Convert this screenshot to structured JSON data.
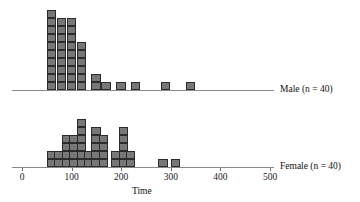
{
  "figure": {
    "axis_title": "Time",
    "male_label": "Male (n = 40)",
    "female_label": "Female (n = 40)",
    "cell_color": "#777777",
    "cell_border_color": "#2b2b2b",
    "axis_color": "#8a8a8a"
  },
  "chart_data": {
    "type": "bar",
    "title": "",
    "subtitle": "",
    "xlabel": "Time",
    "ylabel": "",
    "xlim": [
      0,
      500
    ],
    "grid": false,
    "legend_position": "right",
    "bin_width": 20,
    "tick_values": [
      0,
      100,
      200,
      300,
      400,
      500
    ],
    "tick_labels": [
      "0",
      "100",
      "200",
      "300",
      "400",
      "500"
    ],
    "note": "Back-to-back stacked dotplot / histogram; each square = 1 observation",
    "series": [
      {
        "name": "Male (n = 40)",
        "n": 40,
        "bins": [
          50,
          70,
          90,
          110,
          140,
          160,
          190,
          220,
          280,
          330
        ],
        "values": [
          10,
          9,
          9,
          6,
          2,
          1,
          1,
          1,
          1,
          1
        ]
      },
      {
        "name": "Female (n = 40)",
        "n": 40,
        "bins": [
          50,
          65,
          80,
          95,
          110,
          125,
          140,
          155,
          180,
          195,
          210,
          275,
          300
        ],
        "values": [
          2,
          2,
          4,
          4,
          6,
          2,
          5,
          4,
          2,
          5,
          2,
          1,
          1
        ]
      }
    ]
  }
}
